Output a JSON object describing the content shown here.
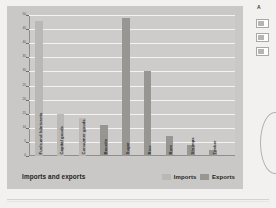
{
  "chart_data": {
    "type": "bar",
    "title": "Imports and exports",
    "xlabel": "",
    "ylabel": "Percentage of total",
    "ylim": [
      0,
      50
    ],
    "yticks": [
      0,
      5,
      10,
      15,
      20,
      25,
      30,
      35,
      40,
      45,
      50
    ],
    "grid": true,
    "legend_position": "bottom-right",
    "categories": [
      "Fuels and lubricants",
      "Capital goods",
      "Consumer goods",
      "Bauxite",
      "Sugar",
      "Rice",
      "Rum",
      "Shrimps",
      "Timber"
    ],
    "values": [
      48,
      15,
      13.5,
      11,
      49,
      30,
      7,
      4,
      2
    ],
    "series_of_bar": [
      "Imports",
      "Imports",
      "Imports",
      "Exports",
      "Exports",
      "Exports",
      "Exports",
      "Exports",
      "Exports"
    ],
    "series": [
      {
        "name": "Imports",
        "color": "#b9b8b6",
        "points": [
          {
            "category": "Fuels and lubricants",
            "value": 48
          },
          {
            "category": "Capital goods",
            "value": 15
          },
          {
            "category": "Consumer goods",
            "value": 13.5
          }
        ]
      },
      {
        "name": "Exports",
        "color": "#979693",
        "points": [
          {
            "category": "Bauxite",
            "value": 11
          },
          {
            "category": "Sugar",
            "value": 49
          },
          {
            "category": "Rice",
            "value": 30
          },
          {
            "category": "Rum",
            "value": 7
          },
          {
            "category": "Shrimps",
            "value": 4
          },
          {
            "category": "Timber",
            "value": 2
          }
        ]
      }
    ]
  },
  "figure": {
    "caption": "Imports and exports",
    "axis_label_y": "Percentage of total"
  },
  "legend": {
    "items": [
      {
        "label": "Imports",
        "color": "#b9b8b6"
      },
      {
        "label": "Exports",
        "color": "#979693"
      }
    ]
  },
  "sidebar": {
    "heading": "A",
    "swatches": [
      "swatch-1",
      "swatch-2",
      "swatch-3"
    ]
  }
}
